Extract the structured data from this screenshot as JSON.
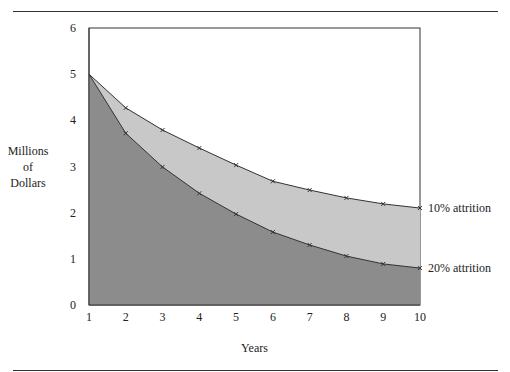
{
  "chart_data": {
    "type": "area",
    "title": "",
    "xlabel": "Years",
    "ylabel": "Millions of Dollars",
    "ylabel_lines": [
      "Millions",
      "of",
      "Dollars"
    ],
    "x": [
      1,
      2,
      3,
      4,
      5,
      6,
      7,
      8,
      9,
      10
    ],
    "xticks": [
      "1",
      "2",
      "3",
      "4",
      "5",
      "6",
      "7",
      "8",
      "9",
      "10"
    ],
    "yticks": [
      "0",
      "1",
      "2",
      "3",
      "4",
      "5",
      "6"
    ],
    "ylim": [
      0,
      6
    ],
    "xlim": [
      1,
      10
    ],
    "grid": false,
    "series": [
      {
        "name": "10% attrition",
        "values": [
          5.0,
          4.27,
          3.79,
          3.4,
          3.03,
          2.68,
          2.49,
          2.32,
          2.19,
          2.1
        ],
        "color": "#c8c8c8"
      },
      {
        "name": "20% attrition",
        "values": [
          5.0,
          3.72,
          2.99,
          2.42,
          1.97,
          1.58,
          1.3,
          1.06,
          0.89,
          0.8
        ],
        "color": "#8c8c8c"
      }
    ]
  }
}
